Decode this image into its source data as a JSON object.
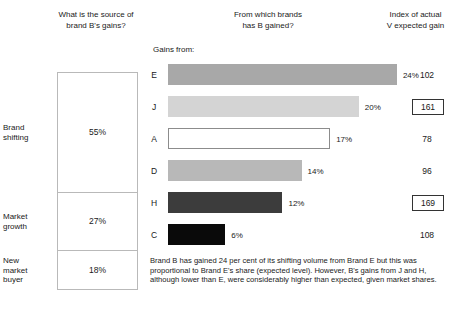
{
  "headers": {
    "left": "What is the source of\nbrand B's gains?",
    "middle": "From which brands\nhas B gained?",
    "right": "Index of actual\nV expected gain"
  },
  "source_panel": {
    "segments": [
      {
        "label": "Brand\nshifting",
        "value": "55%",
        "pct": 55
      },
      {
        "label": "Market\ngrowth",
        "value": "27%",
        "pct": 27
      },
      {
        "label": "New\nmarket\nbuyer",
        "value": "18%",
        "pct": 18
      }
    ]
  },
  "bar_chart_label": "Gains from:",
  "caption": "Brand B has gained 24 per cent of its shifting volume from Brand E but this was proportional to Brand E's share (expected level). However, B's gains from J and H, although lower than E, were considerably higher than expected, given market shares.",
  "chart_data": {
    "type": "bar",
    "title": "From which brands has B gained?",
    "xlabel": "",
    "ylabel": "Gains from:",
    "orientation": "horizontal",
    "categories": [
      "E",
      "J",
      "A",
      "D",
      "H",
      "C"
    ],
    "values": [
      24,
      20,
      17,
      14,
      12,
      6
    ],
    "value_labels": [
      "24%",
      "20%",
      "17%",
      "14%",
      "12%",
      "6%"
    ],
    "xlim": [
      0,
      26
    ],
    "grid": false,
    "legend": null,
    "bar_colors": [
      "#a8a8a8",
      "#d4d4d4",
      "#ffffff",
      "#b8b8b8",
      "#3c3c3c",
      "#0a0a0a"
    ],
    "bar_border_colors": [
      "#a8a8a8",
      "#d4d4d4",
      "#8c8c8c",
      "#b8b8b8",
      "#3c3c3c",
      "#0a0a0a"
    ],
    "series2_name": "Index of actual V expected gain",
    "index_values": [
      102,
      161,
      78,
      96,
      169,
      108
    ],
    "index_highlighted": [
      false,
      true,
      false,
      false,
      true,
      false
    ]
  }
}
